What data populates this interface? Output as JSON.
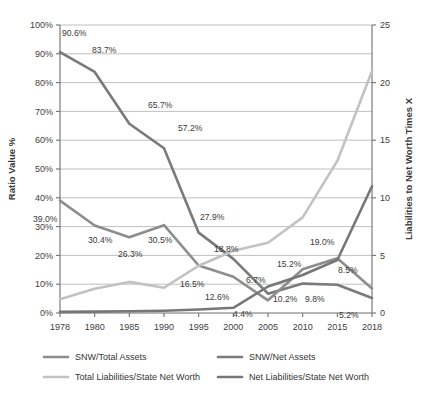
{
  "chart_data": {
    "type": "line",
    "title": "",
    "xlabel": "",
    "ylabel": "Ratio Value %",
    "y2label": "Liabilities to Net Worth Times X",
    "categories": [
      "1978",
      "1980",
      "1985",
      "1990",
      "1995",
      "2000",
      "2005",
      "2010",
      "2015",
      "2018"
    ],
    "ylim": [
      0,
      100
    ],
    "y2lim": [
      0,
      25
    ],
    "yticks": [
      "0%",
      "10%",
      "20%",
      "30%",
      "40%",
      "50%",
      "60%",
      "70%",
      "80%",
      "90%",
      "100%"
    ],
    "y2ticks": [
      "0",
      "5",
      "10",
      "15",
      "20",
      "25"
    ],
    "grid": true,
    "legend_position": "bottom",
    "series": [
      {
        "name": "SNW/Net Assets",
        "axis": "left",
        "color": "#7a7a7a",
        "values": [
          90.6,
          83.7,
          65.7,
          57.2,
          27.9,
          18.8,
          6.7,
          10.2,
          9.8,
          5.2
        ],
        "labels": [
          "90.6%",
          "83.7%",
          "65.7%",
          "57.2%",
          "27.9%",
          "18.8%",
          "6.7%",
          "10.2%",
          "9.8%",
          "5.2%"
        ]
      },
      {
        "name": "SNW/Total Assets",
        "axis": "left",
        "color": "#8d8d8d",
        "values": [
          39.0,
          30.4,
          26.3,
          30.5,
          16.5,
          12.6,
          4.4,
          15.2,
          19.0,
          8.5
        ],
        "labels": [
          "39.0%",
          "30.4%",
          "26.3%",
          "30.5%",
          "16.5%",
          "12.6%",
          "4.4%",
          "15.2%",
          "19.0%",
          "8.5%"
        ]
      },
      {
        "name": "Total Liabilities/State Net Worth",
        "axis": "right",
        "color": "#c2c2c2",
        "values": [
          1.2,
          2.1,
          2.7,
          2.2,
          4.1,
          5.4,
          6.1,
          8.3,
          13.2,
          21.0
        ],
        "labels": [
          "",
          "",
          "",
          "",
          "",
          "",
          "",
          "",
          "",
          ""
        ]
      },
      {
        "name": "Net Liabilities/State Net Worth",
        "axis": "right",
        "color": "#777777",
        "values": [
          0.1,
          0.12,
          0.15,
          0.2,
          0.3,
          0.45,
          2.3,
          3.3,
          4.6,
          11.0
        ],
        "labels": [
          "",
          "",
          "",
          "",
          "",
          "",
          "",
          "",
          "",
          ""
        ]
      }
    ],
    "point_labels": [
      {
        "text": "90.6%",
        "x": 62,
        "y": 36
      },
      {
        "text": "83.7%",
        "x": 92,
        "y": 53
      },
      {
        "text": "65.7%",
        "x": 148,
        "y": 108
      },
      {
        "text": "57.2%",
        "x": 178,
        "y": 131
      },
      {
        "text": "27.9%",
        "x": 200,
        "y": 220
      },
      {
        "text": "18.8%",
        "x": 214,
        "y": 252
      },
      {
        "text": "6.7%",
        "x": 246,
        "y": 283
      },
      {
        "text": "10.2%",
        "x": 273,
        "y": 302
      },
      {
        "text": "9.8%",
        "x": 305,
        "y": 302
      },
      {
        "text": "5.2%",
        "x": 339,
        "y": 318
      },
      {
        "text": "39.0%",
        "x": 33,
        "y": 222
      },
      {
        "text": "30.4%",
        "x": 88,
        "y": 243
      },
      {
        "text": "26.3%",
        "x": 118,
        "y": 257
      },
      {
        "text": "30.5%",
        "x": 148,
        "y": 243
      },
      {
        "text": "16.5%",
        "x": 180,
        "y": 287
      },
      {
        "text": "12.6%",
        "x": 205,
        "y": 300
      },
      {
        "text": "4.4%",
        "x": 233,
        "y": 317
      },
      {
        "text": "15.2%",
        "x": 277,
        "y": 267
      },
      {
        "text": "19.0%",
        "x": 310,
        "y": 245
      },
      {
        "text": "8.5%",
        "x": 338,
        "y": 273
      }
    ]
  },
  "axes": {
    "left_title": "Ratio Value %",
    "right_title": "Liabilities to Net Worth Times X"
  },
  "legend": {
    "items": [
      {
        "label": "SNW/Total Assets",
        "color": "#8d8d8d"
      },
      {
        "label": "SNW/Net Assets",
        "color": "#7a7a7a"
      },
      {
        "label": "Total Liabilities/State Net Worth",
        "color": "#c2c2c2"
      },
      {
        "label": "Net Liabilities/State Net Worth",
        "color": "#777777"
      }
    ]
  }
}
